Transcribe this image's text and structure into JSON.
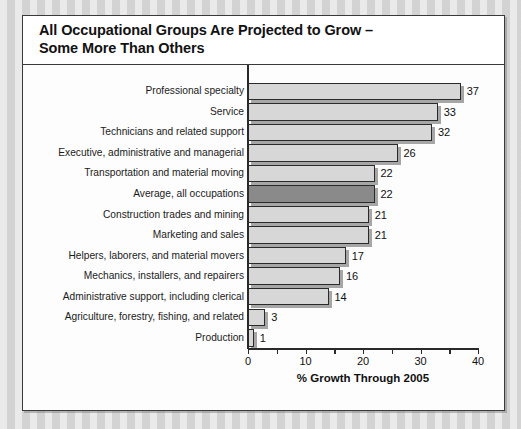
{
  "figure": {
    "title_line_1": "All Occupational Groups Are Projected to Grow –",
    "title_line_2": "Some More Than Others"
  },
  "chart_data": {
    "type": "bar",
    "orientation": "horizontal",
    "title": "All Occupational Groups Are Projected to Grow – Some More Than Others",
    "xlabel": "% Growth Through 2005",
    "ylabel": "",
    "xlim": [
      0,
      40
    ],
    "xticks": [
      0,
      5,
      10,
      15,
      20,
      25,
      30,
      35,
      40
    ],
    "xtick_labels": [
      "0",
      "",
      "10",
      "",
      "20",
      "",
      "30",
      "",
      "40"
    ],
    "grid": false,
    "legend": "none",
    "highlight_category": "Average, all occupations",
    "colors": {
      "bar_fill": "#d7d7d7",
      "bar_highlight_fill": "#8a8a8a",
      "bar_edge": "#2a2a2a",
      "bar_shadow": "#969696",
      "background": "#fdfdfd",
      "page_background": "#d8d8d8"
    },
    "categories": [
      "Professional specialty",
      "Service",
      "Technicians and related support",
      "Executive, administrative and managerial",
      "Transportation and material moving",
      "Average, all occupations",
      "Construction trades and mining",
      "Marketing and sales",
      "Helpers, laborers, and material movers",
      "Mechanics, installers, and repairers",
      "Administrative support, including clerical",
      "Agriculture, forestry, fishing, and related",
      "Production"
    ],
    "values": [
      37,
      33,
      32,
      26,
      22,
      22,
      21,
      21,
      17,
      16,
      14,
      3,
      1
    ],
    "value_labels": [
      "37",
      "33",
      "32",
      "26",
      "22",
      "22",
      "21",
      "21",
      "17",
      "16",
      "14",
      "3",
      "1"
    ]
  }
}
